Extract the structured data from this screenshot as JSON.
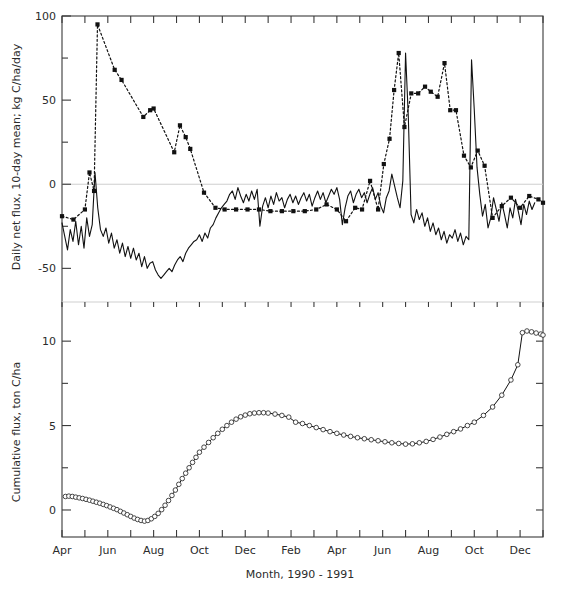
{
  "figure": {
    "xlabel": "Month, 1990 - 1991",
    "panels": [
      {
        "id": "top",
        "ylabel": "Daily net flux, 10-day mean; kg C/ha/day"
      },
      {
        "id": "bottom",
        "ylabel": "Cumulative flux, ton C/ha"
      }
    ]
  },
  "chart_data": [
    {
      "type": "line",
      "panel": "top",
      "title": "",
      "xlabel": "Month, 1990 - 1991",
      "ylabel": "Daily net flux, 10-day mean; kg C/ha/day",
      "ylim": [
        -70,
        100
      ],
      "yticks": [
        -50,
        0,
        50,
        100
      ],
      "yticklabels": [
        "-50",
        "0",
        "50",
        "100"
      ],
      "yminorticks": [
        -25,
        25,
        75
      ],
      "xlim": [
        0,
        21
      ],
      "xticks": [
        0,
        1,
        2,
        3,
        4,
        5,
        6,
        7,
        8,
        9,
        10,
        11,
        12,
        13,
        14,
        15,
        16,
        17,
        18,
        19,
        20,
        21
      ],
      "xticklabels": [
        "Apr",
        "",
        "Jun",
        "",
        "Aug",
        "",
        "Oct",
        "",
        "Dec",
        "",
        "Feb",
        "",
        "Apr",
        "",
        "Jun",
        "",
        "Aug",
        "",
        "Oct",
        "",
        "Dec",
        ""
      ],
      "grid": false,
      "legend": "none",
      "zeroline": 0,
      "series": [
        {
          "name": "Daily net flux (solid, continuous)",
          "style": "solid",
          "marker": "none",
          "x": [
            0.0,
            0.12,
            0.24,
            0.36,
            0.48,
            0.6,
            0.72,
            0.84,
            0.96,
            1.08,
            1.2,
            1.32,
            1.44,
            1.56,
            1.68,
            1.8,
            1.92,
            2.04,
            2.16,
            2.28,
            2.4,
            2.52,
            2.64,
            2.76,
            2.88,
            3.0,
            3.12,
            3.24,
            3.36,
            3.48,
            3.6,
            3.72,
            3.84,
            3.96,
            4.08,
            4.2,
            4.32,
            4.44,
            4.56,
            4.68,
            4.8,
            4.92,
            5.04,
            5.16,
            5.28,
            5.4,
            5.52,
            5.64,
            5.76,
            5.88,
            6.0,
            6.12,
            6.24,
            6.36,
            6.48,
            6.6,
            6.72,
            6.84,
            6.96,
            7.08,
            7.2,
            7.32,
            7.44,
            7.56,
            7.68,
            7.8,
            7.92,
            8.04,
            8.16,
            8.28,
            8.4,
            8.52,
            8.64,
            8.76,
            8.88,
            9.0,
            9.12,
            9.24,
            9.36,
            9.48,
            9.6,
            9.72,
            9.84,
            9.96,
            10.08,
            10.2,
            10.32,
            10.44,
            10.56,
            10.68,
            10.8,
            10.92,
            11.04,
            11.16,
            11.28,
            11.4,
            11.52,
            11.64,
            11.76,
            11.88,
            12.0,
            12.12,
            12.24,
            12.36,
            12.48,
            12.6,
            12.72,
            12.84,
            12.96,
            13.08,
            13.2,
            13.32,
            13.44,
            13.56,
            13.68,
            13.8,
            13.92,
            14.04,
            14.16,
            14.28,
            14.4,
            14.52,
            14.64,
            14.76,
            14.88,
            15.0,
            15.12,
            15.24,
            15.36,
            15.48,
            15.6,
            15.72,
            15.84,
            15.96,
            16.08,
            16.2,
            16.32,
            16.44,
            16.56,
            16.68,
            16.8,
            16.92,
            17.04,
            17.16,
            17.28,
            17.4,
            17.52,
            17.64,
            17.76,
            17.88,
            18.0,
            18.12,
            18.24,
            18.36,
            18.48,
            18.6,
            18.72,
            18.84,
            18.96,
            19.08,
            19.2,
            19.32,
            19.44,
            19.56,
            19.68,
            19.8,
            19.92,
            20.04,
            20.16,
            20.28,
            20.4,
            20.52,
            20.64,
            20.76,
            20.88,
            21.0
          ],
          "y": [
            -23,
            -31,
            -39,
            -27,
            -34,
            -22,
            -36,
            -25,
            -38,
            -20,
            -31,
            -24,
            7,
            -14,
            -27,
            -31,
            -26,
            -35,
            -29,
            -38,
            -33,
            -41,
            -35,
            -43,
            -37,
            -44,
            -38,
            -45,
            -41,
            -49,
            -43,
            -50,
            -47,
            -46,
            -51,
            -54,
            -56,
            -54,
            -52,
            -50,
            -52,
            -48,
            -45,
            -43,
            -46,
            -41,
            -38,
            -36,
            -34,
            -33,
            -30,
            -34,
            -29,
            -32,
            -26,
            -24,
            -20,
            -17,
            -14,
            -12,
            -10,
            -6,
            -4,
            -9,
            -2,
            -7,
            -11,
            -6,
            -10,
            -4,
            -9,
            -3,
            -25,
            -13,
            -8,
            -14,
            -7,
            -12,
            -5,
            -10,
            -8,
            -14,
            -9,
            -6,
            -11,
            -7,
            -12,
            -8,
            -5,
            -10,
            -6,
            -13,
            -8,
            -4,
            -9,
            -5,
            -11,
            -7,
            -3,
            -6,
            -2,
            -9,
            -24,
            -14,
            -7,
            -4,
            -11,
            -6,
            -3,
            -8,
            -5,
            -11,
            -6,
            -2,
            -9,
            -5,
            -13,
            -17,
            -8,
            -4,
            6,
            -1,
            -8,
            -14,
            2,
            78,
            40,
            -18,
            -23,
            -15,
            -21,
            -17,
            -25,
            -20,
            -28,
            -23,
            -30,
            -26,
            -33,
            -28,
            -35,
            -30,
            -32,
            -27,
            -34,
            -29,
            -36,
            -31,
            -33,
            74,
            44,
            10,
            -6,
            -19,
            -12,
            -26,
            -20,
            -8,
            -15,
            -22,
            -11,
            -18,
            -26,
            -14,
            -20,
            -9,
            -16,
            -24,
            -12,
            -18,
            -10,
            -15,
            -11
          ]
        },
        {
          "name": "Daily net flux (dotted, with markers)",
          "style": "dotted",
          "marker": "square",
          "x": [
            0.0,
            0.5,
            1.0,
            1.2,
            1.4,
            1.55,
            2.3,
            2.6,
            3.55,
            3.85,
            4.0,
            4.9,
            5.15,
            5.4,
            5.6,
            6.2,
            6.7,
            7.1,
            7.6,
            8.1,
            8.6,
            9.1,
            9.6,
            10.1,
            10.6,
            11.1,
            11.55,
            12.0,
            12.4,
            12.8,
            13.1,
            13.45,
            13.8,
            14.05,
            14.3,
            14.5,
            14.7,
            14.95,
            15.25,
            15.55,
            15.85,
            16.1,
            16.4,
            16.7,
            16.95,
            17.2,
            17.55,
            17.85,
            18.15,
            18.45,
            18.8,
            19.2,
            19.6,
            20.0,
            20.4,
            20.8,
            21.0
          ],
          "y": [
            -19,
            -21,
            -15,
            7,
            -4,
            95,
            68,
            62,
            40,
            44,
            45,
            19,
            35,
            28,
            21,
            -5,
            -14,
            -15,
            -15,
            -15,
            -15,
            -16,
            -16,
            -16,
            -16,
            -15,
            -12,
            -15,
            -22,
            -14,
            -15,
            2,
            -15,
            12,
            27,
            56,
            78,
            34,
            54,
            54,
            58,
            55,
            52,
            72,
            44,
            44,
            17,
            10,
            20,
            11,
            -20,
            -13,
            -8,
            -14,
            -7,
            -9,
            -11
          ]
        }
      ]
    },
    {
      "type": "line",
      "panel": "bottom",
      "title": "",
      "xlabel": "Month, 1990 - 1991",
      "ylabel": "Cumulative flux, ton C/ha",
      "ylim": [
        -1.6,
        12.2
      ],
      "yticks": [
        0,
        5,
        10
      ],
      "yticklabels": [
        "0",
        "5",
        "10"
      ],
      "yminorticks": [
        2.5,
        7.5
      ],
      "xlim": [
        0,
        21
      ],
      "xticks": [
        0,
        1,
        2,
        3,
        4,
        5,
        6,
        7,
        8,
        9,
        10,
        11,
        12,
        13,
        14,
        15,
        16,
        17,
        18,
        19,
        20,
        21
      ],
      "xticklabels": [
        "Apr",
        "",
        "Jun",
        "",
        "Aug",
        "",
        "Oct",
        "",
        "Dec",
        "",
        "Feb",
        "",
        "Apr",
        "",
        "Jun",
        "",
        "Aug",
        "",
        "Oct",
        "",
        "Dec",
        ""
      ],
      "grid": false,
      "legend": "none",
      "series": [
        {
          "name": "Cumulative flux",
          "style": "solid",
          "marker": "circle",
          "x": [
            0.15,
            0.3,
            0.45,
            0.6,
            0.75,
            0.9,
            1.05,
            1.2,
            1.35,
            1.5,
            1.65,
            1.8,
            1.95,
            2.1,
            2.25,
            2.4,
            2.55,
            2.7,
            2.85,
            3.0,
            3.15,
            3.3,
            3.45,
            3.6,
            3.75,
            3.9,
            4.05,
            4.2,
            4.35,
            4.5,
            4.65,
            4.8,
            4.95,
            5.1,
            5.25,
            5.4,
            5.55,
            5.7,
            5.85,
            6.0,
            6.2,
            6.4,
            6.6,
            6.8,
            7.0,
            7.2,
            7.4,
            7.6,
            7.8,
            8.0,
            8.2,
            8.4,
            8.6,
            8.8,
            9.0,
            9.3,
            9.6,
            9.9,
            10.2,
            10.5,
            10.8,
            11.1,
            11.4,
            11.7,
            12.0,
            12.3,
            12.6,
            12.9,
            13.2,
            13.5,
            13.8,
            14.1,
            14.4,
            14.7,
            15.0,
            15.3,
            15.6,
            15.9,
            16.2,
            16.5,
            16.8,
            17.1,
            17.4,
            17.7,
            18.0,
            18.4,
            18.8,
            19.2,
            19.6,
            19.9,
            20.1,
            20.3,
            20.5,
            20.7,
            20.9,
            21.0
          ],
          "y": [
            0.8,
            0.82,
            0.8,
            0.76,
            0.72,
            0.68,
            0.63,
            0.58,
            0.52,
            0.46,
            0.4,
            0.33,
            0.26,
            0.18,
            0.1,
            0.02,
            -0.08,
            -0.18,
            -0.28,
            -0.38,
            -0.48,
            -0.56,
            -0.62,
            -0.66,
            -0.62,
            -0.52,
            -0.38,
            -0.2,
            0.02,
            0.28,
            0.56,
            0.86,
            1.18,
            1.52,
            1.86,
            2.18,
            2.5,
            2.82,
            3.12,
            3.42,
            3.72,
            4.0,
            4.28,
            4.54,
            4.78,
            5.0,
            5.2,
            5.38,
            5.52,
            5.62,
            5.7,
            5.74,
            5.76,
            5.76,
            5.74,
            5.68,
            5.6,
            5.5,
            5.2,
            5.12,
            5.0,
            4.88,
            4.76,
            4.64,
            4.54,
            4.44,
            4.36,
            4.28,
            4.22,
            4.16,
            4.1,
            4.04,
            3.98,
            3.94,
            3.9,
            3.92,
            3.98,
            4.06,
            4.18,
            4.32,
            4.48,
            4.64,
            4.8,
            5.0,
            5.2,
            5.6,
            6.1,
            6.8,
            7.7,
            8.6,
            10.5,
            10.6,
            10.55,
            10.48,
            10.42,
            10.36,
            10.3
          ]
        }
      ]
    }
  ]
}
